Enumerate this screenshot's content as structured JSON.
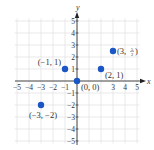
{
  "chart_data": {
    "type": "scatter",
    "title": "",
    "xlabel": "x",
    "ylabel": "y",
    "xlim": [
      -5,
      5
    ],
    "ylim": [
      -5,
      5
    ],
    "grid": true,
    "x_ticks": [
      -5,
      -4,
      -3,
      -2,
      -1,
      3,
      4,
      5
    ],
    "y_ticks": [
      5,
      4,
      3,
      2,
      1,
      -1,
      -2,
      -3,
      -4,
      -5
    ],
    "x_tick_labels": [
      "−5",
      "−4",
      "−3",
      "−2",
      "−1",
      "3",
      "4",
      "5"
    ],
    "y_tick_labels": [
      "5",
      "4",
      "3",
      "2",
      "1",
      "−1",
      "−2",
      "−3",
      "−4",
      "−5"
    ],
    "points": [
      {
        "x": -1,
        "y": 1,
        "label": "(−1, 1)",
        "label_pos": "upper-left"
      },
      {
        "x": 0,
        "y": 0,
        "label": "(0, 0)",
        "label_pos": "lower-right"
      },
      {
        "x": 2,
        "y": 1,
        "label": "(2, 1)",
        "label_pos": "lower-right"
      },
      {
        "x": 3,
        "y": 2.5,
        "label_main": "(3, ",
        "label_frac_num": "5",
        "label_frac_den": "2",
        "label_end": ")",
        "label": "(3, 5/2)",
        "label_pos": "right"
      },
      {
        "x": -3,
        "y": -2,
        "label": "(−3, −2)",
        "label_pos": "below"
      }
    ],
    "colors": {
      "point": "#1a56c4",
      "axis": "#222222",
      "grid": "#e3e3e3",
      "text": "#333333"
    }
  }
}
